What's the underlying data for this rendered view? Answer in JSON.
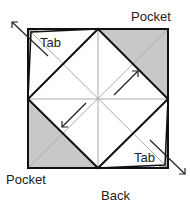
{
  "diagram": {
    "labels": {
      "pocket_top": "Pocket",
      "pocket_bottom": "Pocket",
      "tab_top": "Tab",
      "tab_bottom": "Tab",
      "caption": "Back"
    },
    "colors": {
      "pocket_fill": "#c8c8c8",
      "outline": "#111111",
      "crease": "#aaaaaa"
    }
  }
}
